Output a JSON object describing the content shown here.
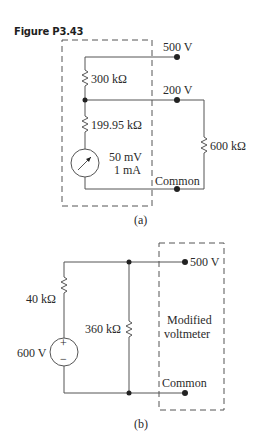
{
  "figure": {
    "title": "Figure P3.43"
  },
  "circuit_a": {
    "caption": "(a)",
    "terminals": {
      "t1": "500 V",
      "t2": "200 V",
      "t3": "Common"
    },
    "resistors": {
      "r1": "300 kΩ",
      "r2": "199.95 kΩ",
      "r3": "600 kΩ"
    },
    "meter": {
      "line1": "50 mV",
      "line2": "1 mA"
    }
  },
  "circuit_b": {
    "caption": "(b)",
    "source": {
      "label": "600 V",
      "plus": "+",
      "minus": "−"
    },
    "resistors": {
      "r1": "40 kΩ",
      "r2": "360 kΩ"
    },
    "box_label": {
      "line1": "Modified",
      "line2": "voltmeter"
    },
    "terminals": {
      "t1": "500 V",
      "t2": "Common"
    }
  },
  "colors": {
    "line": "#444444",
    "text": "#2a2a2a"
  }
}
